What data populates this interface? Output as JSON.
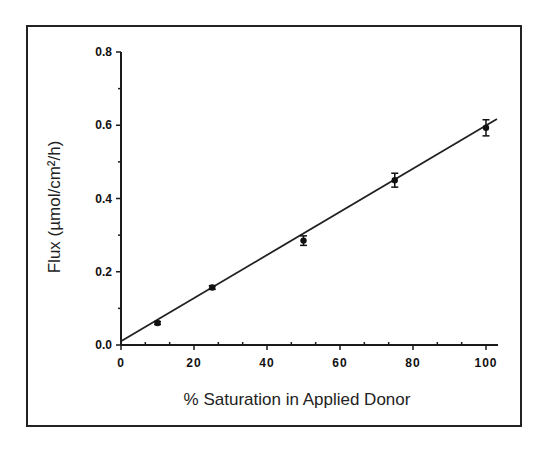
{
  "chart_data": {
    "type": "scatter",
    "title": "",
    "xlabel": "% Saturation in Applied Donor",
    "ylabel": "Flux (µmol/cm²/h)",
    "xlim": [
      0,
      100
    ],
    "ylim": [
      0.0,
      0.8
    ],
    "x_ticks": [
      "0",
      "2 0",
      "4 0",
      "6 0",
      "8 0",
      "1 0 0"
    ],
    "y_ticks": [
      "0.0",
      "0.2",
      "0.4",
      "0.6",
      "0.8"
    ],
    "grid": false,
    "legend": null,
    "series": [
      {
        "name": "Flux",
        "x": [
          10,
          25,
          50,
          75,
          100
        ],
        "y": [
          0.06,
          0.157,
          0.285,
          0.45,
          0.593
        ],
        "error": [
          0.004,
          0.005,
          0.013,
          0.019,
          0.022
        ]
      }
    ],
    "fit_line": {
      "type": "linear",
      "x": [
        0,
        103
      ],
      "y": [
        0.01,
        0.617
      ]
    }
  }
}
